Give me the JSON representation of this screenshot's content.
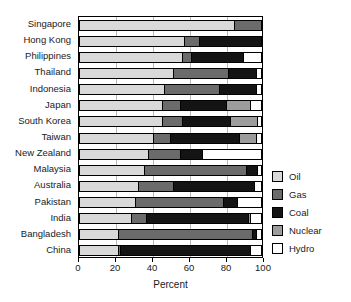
{
  "chart_data": {
    "type": "bar",
    "orientation": "horizontal",
    "stacked": true,
    "title": "",
    "xlabel": "Percent",
    "ylabel": "",
    "xlim": [
      0,
      100
    ],
    "xticks": [
      0,
      20,
      40,
      60,
      80,
      100
    ],
    "grid": true,
    "grid_axis": "x",
    "legend_position": "right",
    "categories": [
      "Singapore",
      "Hong Kong",
      "Philippines",
      "Thailand",
      "Indonesia",
      "Japan",
      "South Korea",
      "Taiwan",
      "New Zealand",
      "Malaysia",
      "Australia",
      "Pakistan",
      "India",
      "Bangladesh",
      "China"
    ],
    "series": [
      {
        "name": "Oil",
        "color": "#d9d9d9",
        "values": [
          85,
          58,
          57,
          52,
          47,
          46,
          46,
          41,
          38,
          36,
          33,
          31,
          29,
          22,
          22
        ]
      },
      {
        "name": "Gas",
        "color": "#6b6b6b",
        "values": [
          15,
          8,
          5,
          30,
          30,
          10,
          11,
          9,
          18,
          56,
          19,
          48,
          8,
          73,
          1
        ]
      },
      {
        "name": "Coal",
        "color": "#141414",
        "values": [
          0,
          34,
          28,
          15,
          20,
          25,
          26,
          38,
          12,
          6,
          44,
          8,
          56,
          2,
          71
        ]
      },
      {
        "name": "Nuclear",
        "color": "#9c9c9c",
        "values": [
          0,
          0,
          0,
          0,
          0,
          13,
          15,
          9,
          0,
          0,
          0,
          0,
          1,
          0,
          0
        ]
      },
      {
        "name": "Hydro",
        "color": "#ffffff",
        "values": [
          0,
          0,
          10,
          3,
          3,
          6,
          2,
          3,
          32,
          2,
          4,
          13,
          6,
          3,
          6
        ]
      }
    ],
    "legend_entries": [
      {
        "label": "Oil",
        "swatch": "oil"
      },
      {
        "label": "Gas",
        "swatch": "gas"
      },
      {
        "label": "Coal",
        "swatch": "coal"
      },
      {
        "label": "Nuclear",
        "swatch": "nuclear"
      },
      {
        "label": "Hydro",
        "swatch": "hydro"
      }
    ]
  }
}
